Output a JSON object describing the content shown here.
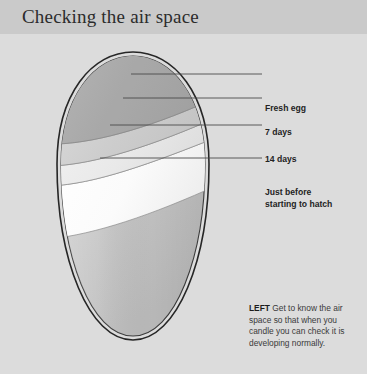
{
  "header": {
    "title": "Checking the air space",
    "background": "#cacaca"
  },
  "page": {
    "background": "#dcdcdc"
  },
  "figure": {
    "name": "egg-air-space-diagram",
    "shell_outline_color": "#262626",
    "labels": [
      {
        "id": "fresh-egg",
        "text": "Fresh egg",
        "leader_y": 74,
        "leader_x_start": 131,
        "leader_x_end": 262
      },
      {
        "id": "7-days",
        "text": "7 days",
        "leader_y": 98,
        "leader_x_start": 123,
        "leader_x_end": 262
      },
      {
        "id": "14-days",
        "text": "14 days",
        "leader_y": 125,
        "leader_x_start": 110,
        "leader_x_end": 262
      },
      {
        "id": "just-before",
        "text": "Just before\nstarting to hatch",
        "leader_y": 158,
        "leader_x_start": 100,
        "leader_x_end": 262
      }
    ],
    "air_space_bands": [
      {
        "id": "band-fresh",
        "fill": "#b4b4b4"
      },
      {
        "id": "band-7days",
        "fill": "#cfcfcf"
      },
      {
        "id": "band-14days",
        "fill": "#e8e8e8"
      },
      {
        "id": "band-just-before",
        "fill": "#fbfbfb"
      }
    ],
    "egg_body_fill_top": "#b9b9b9",
    "egg_body_fill_bottom": "#c4c4c4"
  },
  "caption": {
    "lead": "LEFT",
    "text": " Get to know the air space so that when you candle you can check it is developing normally."
  }
}
